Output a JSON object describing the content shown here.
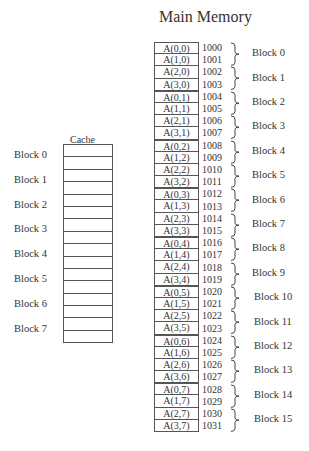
{
  "title": "Main Memory",
  "memory": {
    "entries": [
      {
        "label": "A(0,0)",
        "addr": "1000"
      },
      {
        "label": "A(1,0)",
        "addr": "1001"
      },
      {
        "label": "A(2,0)",
        "addr": "1002"
      },
      {
        "label": "A(3,0)",
        "addr": "1003"
      },
      {
        "label": "A(0,1)",
        "addr": "1004"
      },
      {
        "label": "A(1,1)",
        "addr": "1005"
      },
      {
        "label": "A(2,1)",
        "addr": "1006"
      },
      {
        "label": "A(3,1)",
        "addr": "1007"
      },
      {
        "label": "A(0,2)",
        "addr": "1008"
      },
      {
        "label": "A(1,2)",
        "addr": "1009"
      },
      {
        "label": "A(2,2)",
        "addr": "1010"
      },
      {
        "label": "A(3,2)",
        "addr": "1011"
      },
      {
        "label": "A(0,3)",
        "addr": "1012"
      },
      {
        "label": "A(1,3)",
        "addr": "1013"
      },
      {
        "label": "A(2,3)",
        "addr": "1014"
      },
      {
        "label": "A(3,3)",
        "addr": "1015"
      },
      {
        "label": "A(0,4)",
        "addr": "1016"
      },
      {
        "label": "A(1,4)",
        "addr": "1017"
      },
      {
        "label": "A(2,4)",
        "addr": "1018"
      },
      {
        "label": "A(3,4)",
        "addr": "1019"
      },
      {
        "label": "A(0,5)",
        "addr": "1020"
      },
      {
        "label": "A(1,5)",
        "addr": "1021"
      },
      {
        "label": "A(2,5)",
        "addr": "1022"
      },
      {
        "label": "A(3,5)",
        "addr": "1023"
      },
      {
        "label": "A(0,6)",
        "addr": "1024"
      },
      {
        "label": "A(1,6)",
        "addr": "1025"
      },
      {
        "label": "A(2,6)",
        "addr": "1026"
      },
      {
        "label": "A(3,6)",
        "addr": "1027"
      },
      {
        "label": "A(0,7)",
        "addr": "1028"
      },
      {
        "label": "A(1,7)",
        "addr": "1029"
      },
      {
        "label": "A(2,7)",
        "addr": "1030"
      },
      {
        "label": "A(3,7)",
        "addr": "1031"
      }
    ],
    "blocks": [
      "Block 0",
      "Block 1",
      "Block 2",
      "Block 3",
      "Block 4",
      "Block 5",
      "Block 6",
      "Block 7",
      "Block 8",
      "Block 9",
      "Block 10",
      "Block 11",
      "Block 12",
      "Block 13",
      "Block 14",
      "Block 15"
    ]
  },
  "cache": {
    "title": "Cache",
    "blocks": [
      "Block 0",
      "Block 1",
      "Block 2",
      "Block 3",
      "Block 4",
      "Block 5",
      "Block 6",
      "Block 7"
    ],
    "rows": 16
  }
}
